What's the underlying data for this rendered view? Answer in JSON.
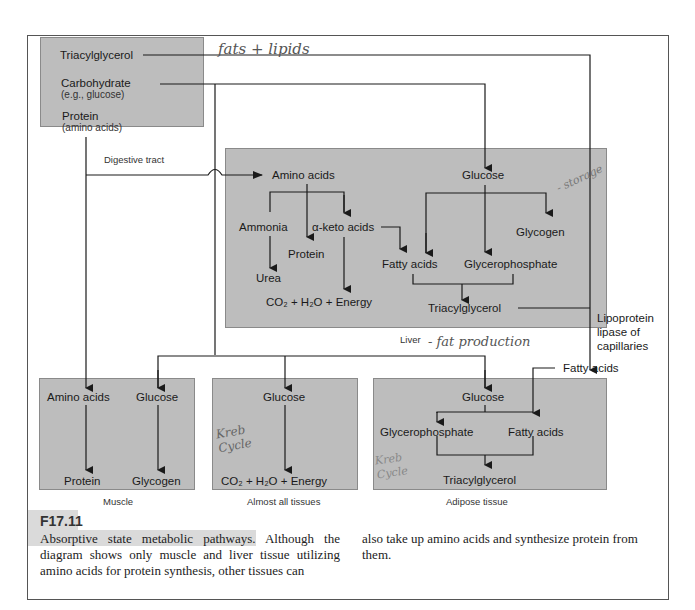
{
  "digestive": {
    "triacylglycerol": "Triacylglycerol",
    "carbohydrate": "Carbohydrate",
    "carbohydrate_sub": "(e.g., glucose)",
    "protein": "Protein",
    "protein_sub": "(amino acids)",
    "label": "Digestive tract"
  },
  "liver": {
    "amino_acids": "Amino acids",
    "ammonia": "Ammonia",
    "keto_acids": "α-keto acids",
    "protein": "Protein",
    "urea": "Urea",
    "co2": "CO₂ + H₂O + Energy",
    "glucose": "Glucose",
    "glycogen": "Glycogen",
    "fatty_acids": "Fatty acids",
    "glycerophosphate": "Glycerophosphate",
    "triacylglycerol": "Triacylglycerol",
    "label": "Liver"
  },
  "lipoprotein": "Lipoprotein\nlipase of\ncapillaries",
  "fatty_acids_mid": "Fatty acids",
  "muscle": {
    "amino_acids": "Amino acids",
    "glucose": "Glucose",
    "protein": "Protein",
    "glycogen": "Glycogen",
    "label": "Muscle"
  },
  "all_tissues": {
    "glucose": "Glucose",
    "co2": "CO₂ + H₂O + Energy",
    "label": "Almost all tissues"
  },
  "adipose": {
    "glucose": "Glucose",
    "glycerophosphate": "Glycerophosphate",
    "fatty_acids": "Fatty acids",
    "triacylglycerol": "Triacylglycerol",
    "label": "Adipose tissue"
  },
  "handwritten": {
    "fats": "fats + lipids",
    "storage": "- storage",
    "fat_production": "- fat production",
    "krebs1": "Kreb Cycle",
    "krebs2": "Kreb Cycle"
  },
  "figure": {
    "number": "F17.11",
    "caption_left": "Absorptive state metabolic pathways. Although the diagram shows only muscle and liver tissue utilizing amino acids for protein synthesis, other tissues can",
    "caption_right": "also take up amino acids and synthesize protein from them."
  }
}
